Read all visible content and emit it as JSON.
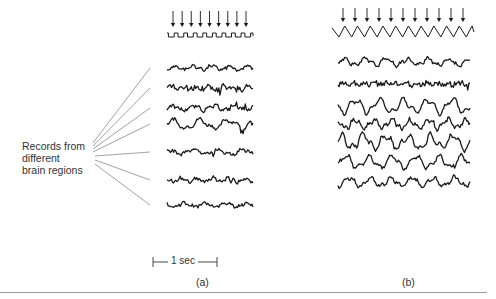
{
  "figure": {
    "region_label": [
      "Records from",
      "different",
      "brain regions"
    ],
    "scale_bar": {
      "text": "1 sec"
    },
    "panels": [
      {
        "id": "a",
        "label": "(a)",
        "arrow_count": 9,
        "stimulus": "square-wave",
        "trace_count": 7
      },
      {
        "id": "b",
        "label": "(b)",
        "arrow_count": 11,
        "stimulus": "zigzag-wave",
        "trace_count": 7
      }
    ],
    "colors": {
      "ink": "#1a1a1a",
      "fan_lines": "#8a8a8a",
      "rule": "#9a9a9a",
      "background": "#ffffff"
    }
  },
  "chart_data": {
    "type": "line",
    "title": "",
    "annotations": [
      "Records from different brain regions",
      "1 sec",
      "(a)",
      "(b)"
    ],
    "series": [
      {
        "panel": "a",
        "name": "stimulus",
        "shape": "square",
        "cycles": 9
      },
      {
        "panel": "a",
        "name": "trace-1",
        "amplitude": "low"
      },
      {
        "panel": "a",
        "name": "trace-2",
        "amplitude": "low-spiky"
      },
      {
        "panel": "a",
        "name": "trace-3",
        "amplitude": "low"
      },
      {
        "panel": "a",
        "name": "trace-4",
        "amplitude": "medium"
      },
      {
        "panel": "a",
        "name": "trace-5",
        "amplitude": "low"
      },
      {
        "panel": "a",
        "name": "trace-6",
        "amplitude": "low"
      },
      {
        "panel": "a",
        "name": "trace-7",
        "amplitude": "low"
      },
      {
        "panel": "b",
        "name": "stimulus",
        "shape": "zigzag",
        "cycles": 11
      },
      {
        "panel": "b",
        "name": "trace-1",
        "amplitude": "medium"
      },
      {
        "panel": "b",
        "name": "trace-2",
        "amplitude": "low-spiky"
      },
      {
        "panel": "b",
        "name": "trace-3",
        "amplitude": "high"
      },
      {
        "panel": "b",
        "name": "trace-4",
        "amplitude": "medium-high"
      },
      {
        "panel": "b",
        "name": "trace-5",
        "amplitude": "high"
      },
      {
        "panel": "b",
        "name": "trace-6",
        "amplitude": "high"
      },
      {
        "panel": "b",
        "name": "trace-7",
        "amplitude": "medium"
      }
    ]
  }
}
